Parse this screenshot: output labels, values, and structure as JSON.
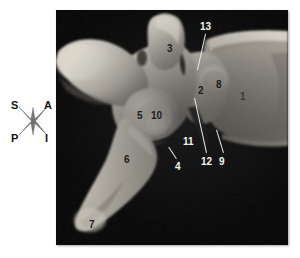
{
  "figure": {
    "kind": "anatomical-photograph",
    "background_color": "#ffffff",
    "frame_color": "#000000"
  },
  "orientation": {
    "name": "orientation-compass",
    "superior": "S",
    "anterior": "A",
    "posterior": "P",
    "inferior": "I"
  },
  "labels": [
    {
      "id": "1",
      "text": "1",
      "x": 184,
      "y": 82,
      "tone": "faint"
    },
    {
      "id": "2",
      "text": "2",
      "x": 142,
      "y": 76,
      "tone": "dark"
    },
    {
      "id": "3",
      "text": "3",
      "x": 111,
      "y": 34,
      "tone": "dark"
    },
    {
      "id": "4",
      "text": "4",
      "x": 119,
      "y": 152,
      "tone": "light"
    },
    {
      "id": "5",
      "text": "5",
      "x": 81,
      "y": 101,
      "tone": "dark"
    },
    {
      "id": "6",
      "text": "6",
      "x": 68,
      "y": 145,
      "tone": "dark"
    },
    {
      "id": "7",
      "text": "7",
      "x": 33,
      "y": 210,
      "tone": "dark"
    },
    {
      "id": "8",
      "text": "8",
      "x": 160,
      "y": 70,
      "tone": "dark"
    },
    {
      "id": "9",
      "text": "9",
      "x": 163,
      "y": 147,
      "tone": "light"
    },
    {
      "id": "10",
      "text": "10",
      "x": 95,
      "y": 101,
      "tone": "dark"
    },
    {
      "id": "11",
      "text": "11",
      "x": 127,
      "y": 127,
      "tone": "light"
    },
    {
      "id": "12",
      "text": "12",
      "x": 145,
      "y": 147,
      "tone": "light"
    },
    {
      "id": "13",
      "text": "13",
      "x": 144,
      "y": 12,
      "tone": "light"
    }
  ],
  "leader_lines": [
    {
      "for": "13",
      "x1": 150,
      "y1": 24,
      "x2": 142,
      "y2": 60,
      "tone": "light"
    },
    {
      "for": "12",
      "x1": 150,
      "y1": 143,
      "x2": 138,
      "y2": 88,
      "tone": "light"
    },
    {
      "for": "9",
      "x1": 167,
      "y1": 143,
      "x2": 160,
      "y2": 120,
      "tone": "light"
    },
    {
      "for": "4",
      "x1": 120,
      "y1": 149,
      "x2": 112,
      "y2": 137,
      "tone": "light"
    }
  ]
}
